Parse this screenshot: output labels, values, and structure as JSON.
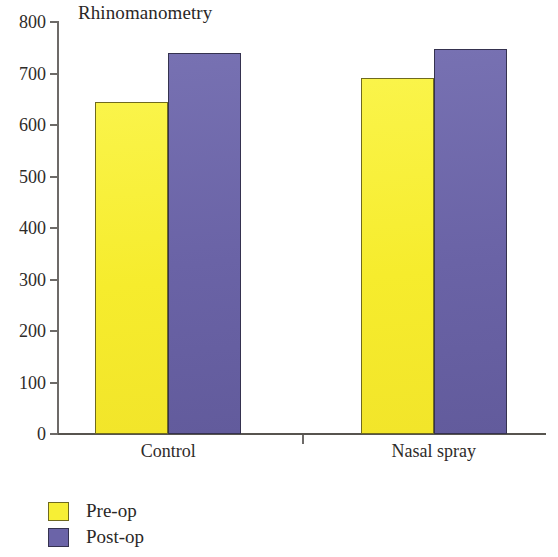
{
  "chart_data": {
    "type": "bar",
    "title": "Rhinomanometry",
    "xlabel": "",
    "ylabel": "",
    "ylim": [
      0,
      800
    ],
    "ytick_step": 100,
    "yticks": [
      "800",
      "700",
      "600",
      "500",
      "400",
      "300",
      "200",
      "100",
      "0"
    ],
    "grid": false,
    "legend_position": "bottom-left",
    "categories": [
      "Control",
      "Nasal spray"
    ],
    "series": [
      {
        "name": "Pre-op",
        "color": "#F7EF35",
        "values": [
          645,
          692
        ]
      },
      {
        "name": "Post-op",
        "color": "#6B64A8",
        "values": [
          740,
          747
        ]
      }
    ]
  },
  "axis": {
    "y_ticks": [
      {
        "label": "800",
        "value": 800
      },
      {
        "label": "700",
        "value": 700
      },
      {
        "label": "600",
        "value": 600
      },
      {
        "label": "500",
        "value": 500
      },
      {
        "label": "400",
        "value": 400
      },
      {
        "label": "300",
        "value": 300
      },
      {
        "label": "200",
        "value": 200
      },
      {
        "label": "100",
        "value": 100
      },
      {
        "label": "0",
        "value": 0
      }
    ],
    "x_categories": [
      {
        "label": "Control"
      },
      {
        "label": "Nasal spray"
      }
    ]
  },
  "legend": {
    "items": [
      {
        "label": "Pre-op",
        "color": "#F7EF35"
      },
      {
        "label": "Post-op",
        "color": "#6B64A8"
      }
    ]
  }
}
